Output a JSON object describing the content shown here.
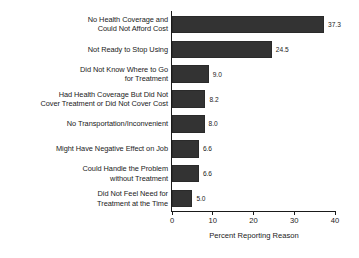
{
  "chart_data": {
    "type": "bar",
    "orientation": "horizontal",
    "title": "",
    "xlabel": "Percent Reporting Reason",
    "ylabel": "",
    "xlim": [
      0,
      40
    ],
    "xticks": [
      0,
      10,
      20,
      30,
      40
    ],
    "xtick_labels": [
      "0",
      "10",
      "20",
      "30",
      "40"
    ],
    "grid": false,
    "legend": "none",
    "bar_color": "#333333",
    "categories": [
      "No Health Coverage and\nCould Not Afford Cost",
      "Not Ready to Stop Using",
      "Did Not Know Where to Go\nfor Treatment",
      "Had Health Coverage But Did Not\nCover Treatment or Did Not Cover Cost",
      "No Transportation/Inconvenient",
      "Might Have Negative Effect on Job",
      "Could Handle the Problem\nwithout Treatment",
      "Did Not Feel Need for\nTreatment at the Time"
    ],
    "values": [
      37.3,
      24.5,
      9.0,
      8.2,
      8.0,
      6.6,
      6.6,
      5.0
    ],
    "value_labels": [
      "37.3",
      "24.5",
      "9.0",
      "8.2",
      "8.0",
      "6.6",
      "6.6",
      "5.0"
    ]
  }
}
